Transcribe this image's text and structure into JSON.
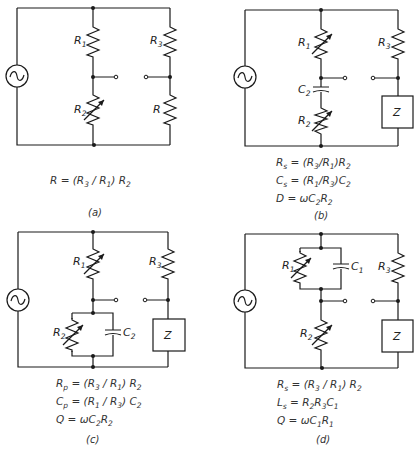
{
  "figure": {
    "panels": [
      {
        "id": "a",
        "caption": "(a)",
        "labels": {
          "r1": "R",
          "r1_sub": "1",
          "r2": "R",
          "r2_sub": "2",
          "r3": "R",
          "r3_sub": "3",
          "r": "R"
        },
        "variable": [
          "R2"
        ],
        "equations": [
          "R = (R3 / R1) R2"
        ],
        "eq_parts": [
          {
            "lhs": "R",
            "mid": " = (R",
            "s1": "3",
            "m2": " / R",
            "s2": "1",
            "m3": ") R",
            "s3": "2"
          }
        ]
      },
      {
        "id": "b",
        "caption": "(b)",
        "labels": {
          "r1": "R",
          "r1_sub": "1",
          "c2": "C",
          "c2_sub": "2",
          "r2": "R",
          "r2_sub": "2",
          "r3": "R",
          "r3_sub": "3",
          "z": "Z"
        },
        "variable": [
          "R1",
          "R2"
        ],
        "equations": [
          "Rs = (R3/R1)R2",
          "Cs = (R1/R3)C2",
          "D = ωC2R2"
        ],
        "eq_parts": [
          {
            "a": "R",
            "as": "s",
            "b": " = (R",
            "bs": "3",
            "c": "/R",
            "cs": "1",
            "d": ")R",
            "ds": "2"
          },
          {
            "a": "C",
            "as": "s",
            "b": " = (R",
            "bs": "1",
            "c": "/R",
            "cs": "3",
            "d": ")C",
            "ds": "2"
          },
          {
            "a": "D",
            "b": " = ωC",
            "bs": "2",
            "c": "R",
            "cs": "2"
          }
        ]
      },
      {
        "id": "c",
        "caption": "(c)",
        "labels": {
          "r1": "R",
          "r1_sub": "1",
          "r2": "R",
          "r2_sub": "2",
          "c2": "C",
          "c2_sub": "2",
          "r3": "R",
          "r3_sub": "3",
          "z": "Z"
        },
        "variable": [
          "R1",
          "R2"
        ],
        "equations": [
          "Rp = (R3 / R1) R2",
          "Cp = (R1 / R3) C2",
          "Q = ωC2R2"
        ],
        "eq_parts": [
          {
            "a": "R",
            "as": "p",
            "b": " = (R",
            "bs": "3",
            "c": " / R",
            "cs": "1",
            "d": ") R",
            "ds": "2"
          },
          {
            "a": "C",
            "as": "p",
            "b": " = (R",
            "bs": "1",
            "c": " / R",
            "cs": "3",
            "d": ") C",
            "ds": "2"
          },
          {
            "a": "Q",
            "b": " = ωC",
            "bs": "2",
            "c": "R",
            "cs": "2"
          }
        ]
      },
      {
        "id": "d",
        "caption": "(d)",
        "labels": {
          "r1": "R",
          "r1_sub": "1",
          "c1": "C",
          "c1_sub": "1",
          "r2": "R",
          "r2_sub": "2",
          "r3": "R",
          "r3_sub": "3",
          "z": "Z"
        },
        "variable": [
          "R1",
          "R2"
        ],
        "equations": [
          "Rs = (R3 / R1) R2",
          "Ls = R2R3C1",
          "Q = ωC1R1"
        ],
        "eq_parts": [
          {
            "a": "R",
            "as": "s",
            "b": " = (R",
            "bs": "3",
            "c": " / R",
            "cs": "1",
            "d": ") R",
            "ds": "2"
          },
          {
            "a": "L",
            "as": "s",
            "b": " = R",
            "bs": "2",
            "c": "R",
            "cs": "3",
            "d": "C",
            "ds": "1"
          },
          {
            "a": "Q",
            "b": " = ωC",
            "bs": "1",
            "c": "R",
            "cs": "1"
          }
        ]
      }
    ],
    "colors": {
      "line": "#1a1a1a",
      "text": "#333333",
      "background": "#ffffff"
    }
  }
}
